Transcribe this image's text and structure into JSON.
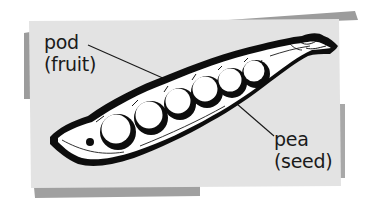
{
  "figure": {
    "background_color": "#ffffff",
    "card_color": "#e3e3e3",
    "shadow_color": "#9a9a9a",
    "ink_color": "#0d0d0d",
    "pea_fill": "#ffffff"
  },
  "labels": {
    "pod": {
      "term": "pod",
      "description": "(fruit)"
    },
    "pea": {
      "term": "pea",
      "description": "(seed)"
    }
  },
  "diagram": {
    "pea_count": 7
  }
}
